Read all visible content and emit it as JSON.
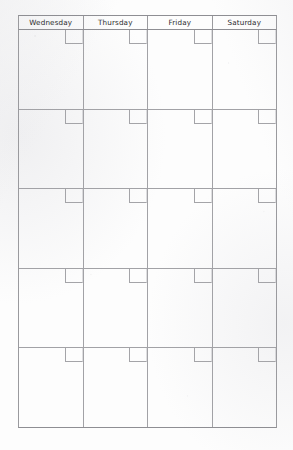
{
  "document": {
    "kind": "blank-monthly-calendar-grid",
    "medium": "scanned-paper"
  },
  "calendar": {
    "columns": [
      {
        "label": "Wednesday"
      },
      {
        "label": "Thursday"
      },
      {
        "label": "Friday"
      },
      {
        "label": "Saturday"
      }
    ],
    "weeks": [
      {
        "cells": [
          {
            "date": ""
          },
          {
            "date": ""
          },
          {
            "date": ""
          },
          {
            "date": ""
          }
        ]
      },
      {
        "cells": [
          {
            "date": ""
          },
          {
            "date": ""
          },
          {
            "date": ""
          },
          {
            "date": ""
          }
        ]
      },
      {
        "cells": [
          {
            "date": ""
          },
          {
            "date": ""
          },
          {
            "date": ""
          },
          {
            "date": ""
          }
        ]
      },
      {
        "cells": [
          {
            "date": ""
          },
          {
            "date": ""
          },
          {
            "date": ""
          },
          {
            "date": ""
          }
        ]
      },
      {
        "cells": [
          {
            "date": ""
          },
          {
            "date": ""
          },
          {
            "date": ""
          },
          {
            "date": ""
          }
        ]
      }
    ]
  },
  "colors": {
    "paper": "#fdfdfd",
    "grid_line": "#a2a2a6",
    "border_line": "#8e8e93",
    "header_text": "#2b2b2e"
  }
}
